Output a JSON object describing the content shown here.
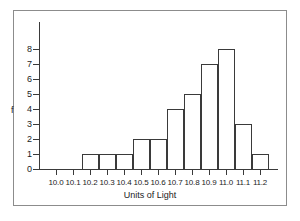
{
  "chart_data": {
    "type": "bar",
    "title": "",
    "subtitle": "",
    "xlabel": "Units of Light",
    "ylabel": "f",
    "categories": [
      "10.0",
      "10.1",
      "10.2",
      "10.3",
      "10.4",
      "10.5",
      "10.6",
      "10.7",
      "10.8",
      "10.9",
      "11.0",
      "11.1",
      "11.2"
    ],
    "values": [
      0,
      0,
      1,
      1,
      1,
      2,
      2,
      4,
      5,
      7,
      8,
      3,
      1
    ],
    "xtick_labels": [
      "10.0",
      "10.1",
      "10.2",
      "10.3",
      "10.4",
      "10.5",
      "10.6",
      "10.7",
      "10.8",
      "10.9",
      "11.0",
      "11.1",
      "11.2"
    ],
    "ytick_labels": [
      "0",
      "1",
      "2",
      "3",
      "4",
      "5",
      "6",
      "7",
      "8"
    ],
    "ytick_values": [
      0,
      1,
      2,
      3,
      4,
      5,
      6,
      7,
      8
    ],
    "ylim": [
      0,
      8
    ],
    "grid": false,
    "legend": null,
    "legend_position": "none",
    "bar_style": "outline",
    "line_color": "#3a3a3a",
    "fill_color": "#ffffff",
    "background_color": "#ffffff",
    "border_color": "#8c8c8c"
  }
}
